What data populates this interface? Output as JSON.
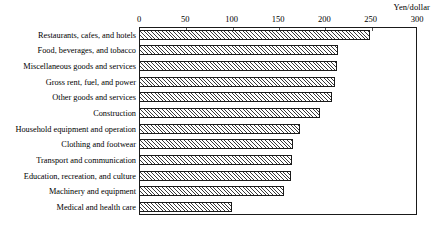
{
  "chart_data": {
    "type": "bar",
    "orientation": "horizontal",
    "title": "",
    "xlabel": "Yen/dollar",
    "ylabel": "",
    "xlim": [
      0,
      300
    ],
    "grid": false,
    "legend": null,
    "ticks": [
      "0",
      "50",
      "100",
      "150",
      "200",
      "250",
      "300"
    ],
    "tick_values": [
      0,
      50,
      100,
      150,
      200,
      250,
      300
    ],
    "categories": [
      "Restaurants, cafes, and hotels",
      "Food, beverages, and tobacco",
      "Miscellaneous goods and services",
      "Gross rent, fuel, and power",
      "Other goods and services",
      "Construction",
      "Household equipment and operation",
      "Clothing and footwear",
      "Transport and communication",
      "Education, recreation, and culture",
      "Machinery and equipment",
      "Medical and health care"
    ],
    "values": [
      249,
      215,
      214,
      212,
      208,
      195,
      174,
      166,
      165,
      164,
      157,
      100
    ]
  },
  "axis": {
    "unit_caption": "Yen/dollar"
  },
  "colors": {
    "bar_edge": "#1a1a1a",
    "bar_hatch": "#3a3a3a",
    "frame": "#1a1a1a",
    "text": "#000000",
    "background": "#ffffff"
  }
}
